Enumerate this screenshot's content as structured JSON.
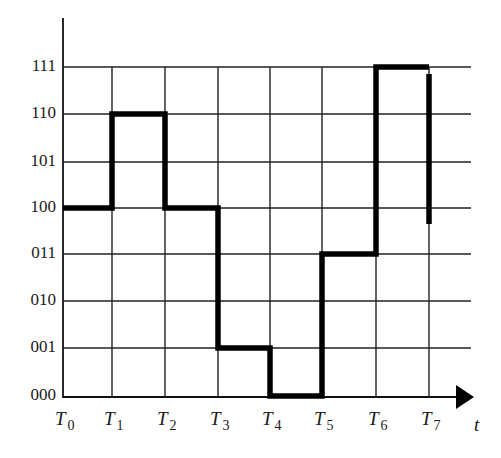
{
  "chart_data": {
    "type": "line",
    "subtype": "step",
    "title": "",
    "xlabel": "t",
    "ylabel": "",
    "x_ticks": [
      "T0",
      "T1",
      "T2",
      "T3",
      "T4",
      "T5",
      "T6",
      "T7"
    ],
    "x_tick_parts": [
      {
        "base": "T",
        "sub": "0"
      },
      {
        "base": "T",
        "sub": "1"
      },
      {
        "base": "T",
        "sub": "2"
      },
      {
        "base": "T",
        "sub": "3"
      },
      {
        "base": "T",
        "sub": "4"
      },
      {
        "base": "T",
        "sub": "5"
      },
      {
        "base": "T",
        "sub": "6"
      },
      {
        "base": "T",
        "sub": "7"
      }
    ],
    "y_ticks": [
      "000",
      "001",
      "010",
      "011",
      "100",
      "101",
      "110",
      "111"
    ],
    "grid": true,
    "series": [
      {
        "name": "signal",
        "intervals": [
          {
            "from": "T0",
            "to": "T1",
            "value": "100"
          },
          {
            "from": "T1",
            "to": "T2",
            "value": "110"
          },
          {
            "from": "T2",
            "to": "T3",
            "value": "100"
          },
          {
            "from": "T3",
            "to": "T4",
            "value": "001"
          },
          {
            "from": "T4",
            "to": "T5",
            "value": "000"
          },
          {
            "from": "T5",
            "to": "T6",
            "value": "011"
          },
          {
            "from": "T6",
            "to": "T7",
            "value": "111"
          }
        ],
        "values": [
          4,
          6,
          4,
          1,
          0,
          3,
          7
        ],
        "final_drop_at_T7_to": "~100"
      }
    ],
    "ylim": [
      0,
      7
    ],
    "legend": null
  },
  "axis": {
    "t_label": "t"
  }
}
